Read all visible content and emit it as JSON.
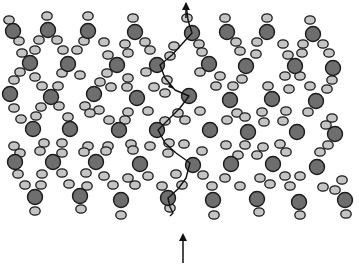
{
  "diagram": {
    "colors": {
      "background": "#ffffff",
      "large_atom_fill": "#6e6e6e",
      "small_atom_fill": "#c4c4c4",
      "atom_stroke": "#1a1a1a",
      "path_stroke": "#111111"
    },
    "large_atoms": [
      [
        13,
        31
      ],
      [
        48,
        30
      ],
      [
        88,
        31
      ],
      [
        135,
        32
      ],
      [
        192,
        33
      ],
      [
        227,
        32
      ],
      [
        267,
        32
      ],
      [
        313,
        34
      ],
      [
        30,
        63
      ],
      [
        68,
        64
      ],
      [
        117,
        65
      ],
      [
        157,
        65
      ],
      [
        209,
        64
      ],
      [
        246,
        66
      ],
      [
        295,
        66
      ],
      [
        333,
        68
      ],
      [
        10,
        94
      ],
      [
        51,
        97
      ],
      [
        94,
        94
      ],
      [
        137,
        98
      ],
      [
        189,
        96
      ],
      [
        230,
        100
      ],
      [
        272,
        99
      ],
      [
        316,
        101
      ],
      [
        33,
        129
      ],
      [
        70,
        129
      ],
      [
        119,
        130
      ],
      [
        157,
        130
      ],
      [
        210,
        130
      ],
      [
        248,
        132
      ],
      [
        297,
        132
      ],
      [
        335,
        134
      ],
      [
        15,
        162
      ],
      [
        53,
        162
      ],
      [
        96,
        162
      ],
      [
        140,
        164
      ],
      [
        193,
        165
      ],
      [
        231,
        164
      ],
      [
        273,
        164
      ],
      [
        317,
        167
      ],
      [
        35,
        197
      ],
      [
        80,
        196
      ],
      [
        121,
        200
      ],
      [
        168,
        198
      ],
      [
        213,
        200
      ],
      [
        257,
        199
      ],
      [
        299,
        202
      ],
      [
        345,
        200
      ]
    ],
    "small_atoms": [
      [
        9,
        20
      ],
      [
        47,
        16
      ],
      [
        88,
        16
      ],
      [
        133,
        18
      ],
      [
        187,
        18
      ],
      [
        225,
        18
      ],
      [
        267,
        18
      ],
      [
        310,
        20
      ],
      [
        19,
        41
      ],
      [
        39,
        40
      ],
      [
        57,
        40
      ],
      [
        84,
        41
      ],
      [
        104,
        42
      ],
      [
        125,
        44
      ],
      [
        145,
        42
      ],
      [
        174,
        46
      ],
      [
        199,
        44
      ],
      [
        236,
        42
      ],
      [
        257,
        42
      ],
      [
        283,
        44
      ],
      [
        303,
        44
      ],
      [
        323,
        44
      ],
      [
        22,
        53
      ],
      [
        35,
        50
      ],
      [
        63,
        50
      ],
      [
        77,
        50
      ],
      [
        108,
        55
      ],
      [
        128,
        53
      ],
      [
        150,
        50
      ],
      [
        170,
        56
      ],
      [
        202,
        52
      ],
      [
        240,
        51
      ],
      [
        256,
        54
      ],
      [
        288,
        55
      ],
      [
        302,
        53
      ],
      [
        329,
        53
      ],
      [
        20,
        72
      ],
      [
        35,
        77
      ],
      [
        62,
        73
      ],
      [
        80,
        75
      ],
      [
        107,
        73
      ],
      [
        128,
        78
      ],
      [
        146,
        72
      ],
      [
        167,
        80
      ],
      [
        200,
        72
      ],
      [
        220,
        76
      ],
      [
        242,
        79
      ],
      [
        285,
        76
      ],
      [
        300,
        76
      ],
      [
        332,
        80
      ],
      [
        14,
        80
      ],
      [
        42,
        86
      ],
      [
        58,
        86
      ],
      [
        100,
        82
      ],
      [
        111,
        87
      ],
      [
        127,
        87
      ],
      [
        154,
        87
      ],
      [
        165,
        93
      ],
      [
        216,
        86
      ],
      [
        233,
        86
      ],
      [
        268,
        86
      ],
      [
        289,
        89
      ],
      [
        310,
        86
      ],
      [
        327,
        89
      ],
      [
        14,
        108
      ],
      [
        41,
        107
      ],
      [
        59,
        106
      ],
      [
        85,
        106
      ],
      [
        99,
        110
      ],
      [
        128,
        112
      ],
      [
        148,
        111
      ],
      [
        178,
        113
      ],
      [
        200,
        111
      ],
      [
        237,
        113
      ],
      [
        262,
        112
      ],
      [
        286,
        111
      ],
      [
        308,
        112
      ],
      [
        332,
        118
      ],
      [
        21,
        119
      ],
      [
        36,
        116
      ],
      [
        68,
        117
      ],
      [
        90,
        113
      ],
      [
        109,
        120
      ],
      [
        125,
        120
      ],
      [
        165,
        121
      ],
      [
        185,
        120
      ],
      [
        227,
        120
      ],
      [
        245,
        117
      ],
      [
        264,
        122
      ],
      [
        283,
        121
      ],
      [
        326,
        125
      ],
      [
        14,
        146
      ],
      [
        44,
        143
      ],
      [
        62,
        143
      ],
      [
        88,
        146
      ],
      [
        108,
        146
      ],
      [
        131,
        144
      ],
      [
        150,
        146
      ],
      [
        169,
        143
      ],
      [
        184,
        144
      ],
      [
        226,
        145
      ],
      [
        245,
        145
      ],
      [
        263,
        147
      ],
      [
        280,
        144
      ],
      [
        328,
        145
      ],
      [
        20,
        153
      ],
      [
        40,
        151
      ],
      [
        62,
        153
      ],
      [
        84,
        152
      ],
      [
        106,
        151
      ],
      [
        133,
        150
      ],
      [
        168,
        153
      ],
      [
        202,
        151
      ],
      [
        238,
        155
      ],
      [
        257,
        155
      ],
      [
        286,
        152
      ],
      [
        320,
        152
      ],
      [
        18,
        174
      ],
      [
        42,
        174
      ],
      [
        62,
        173
      ],
      [
        86,
        173
      ],
      [
        104,
        176
      ],
      [
        128,
        178
      ],
      [
        148,
        176
      ],
      [
        176,
        174
      ],
      [
        203,
        175
      ],
      [
        225,
        178
      ],
      [
        260,
        178
      ],
      [
        285,
        176
      ],
      [
        300,
        176
      ],
      [
        342,
        180
      ],
      [
        25,
        185
      ],
      [
        41,
        185
      ],
      [
        69,
        184
      ],
      [
        87,
        186
      ],
      [
        113,
        185
      ],
      [
        135,
        185
      ],
      [
        162,
        186
      ],
      [
        182,
        185
      ],
      [
        212,
        186
      ],
      [
        240,
        186
      ],
      [
        270,
        184
      ],
      [
        290,
        186
      ],
      [
        323,
        187
      ],
      [
        335,
        190
      ],
      [
        35,
        211
      ],
      [
        81,
        209
      ],
      [
        121,
        215
      ],
      [
        170,
        208
      ],
      [
        214,
        215
      ],
      [
        259,
        212
      ],
      [
        300,
        215
      ],
      [
        346,
        214
      ]
    ],
    "path": {
      "points": [
        [
          186,
          3
        ],
        [
          188,
          20
        ],
        [
          192,
          33
        ],
        [
          182,
          44
        ],
        [
          172,
          55
        ],
        [
          160,
          65
        ],
        [
          165,
          78
        ],
        [
          175,
          90
        ],
        [
          189,
          96
        ],
        [
          180,
          108
        ],
        [
          170,
          118
        ],
        [
          158,
          130
        ],
        [
          165,
          143
        ],
        [
          176,
          153
        ],
        [
          190,
          163
        ],
        [
          186,
          178
        ],
        [
          178,
          189
        ],
        [
          168,
          198
        ],
        [
          170,
          207
        ],
        [
          173,
          213
        ],
        [
          170,
          216
        ]
      ],
      "mid_arrow": [
        173,
        86
      ]
    },
    "arrows": {
      "top": {
        "x": 186,
        "y1": 18,
        "y2": 2
      },
      "bottom": {
        "x": 183,
        "y1": 263,
        "y2": 233
      }
    }
  }
}
